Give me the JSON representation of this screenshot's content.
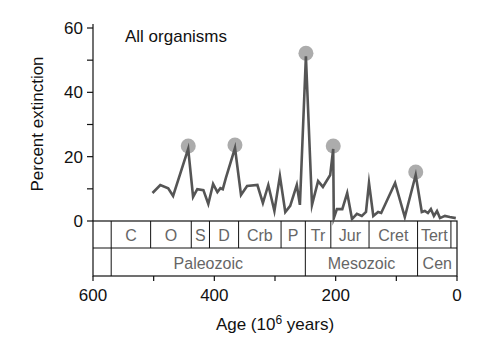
{
  "chart_data": {
    "type": "line",
    "title": "All organisms",
    "xlabel": "Age (10⁶ years)",
    "xlabel_parts": {
      "main": "Age (10",
      "sup": "6",
      "tail": " years)"
    },
    "ylabel": "Percent extinction",
    "xlim": [
      600,
      0
    ],
    "ylim": [
      0,
      60
    ],
    "x_ticks": [
      600,
      500,
      400,
      300,
      200,
      100,
      0
    ],
    "x_tick_labels": [
      "600",
      "400",
      "200",
      "0"
    ],
    "x_tick_label_values": [
      600,
      400,
      200,
      0
    ],
    "y_ticks": [
      0,
      10,
      20,
      30,
      40,
      50,
      60
    ],
    "y_tick_labels": [
      "0",
      "20",
      "40",
      "60"
    ],
    "y_tick_label_values": [
      0,
      20,
      40,
      60
    ],
    "grid": false,
    "legend": null,
    "series": [
      {
        "name": "All organisms",
        "color": "#555555",
        "x": [
          502,
          489,
          476,
          468,
          443,
          435,
          428,
          418,
          410,
          402,
          395,
          390,
          386,
          381,
          366,
          356,
          346,
          329,
          320,
          311,
          301,
          292,
          283,
          275,
          264,
          259,
          249,
          239,
          229,
          221,
          209,
          204,
          203,
          198,
          189,
          181,
          173,
          165,
          157,
          150,
          145,
          138,
          130,
          125,
          102,
          86,
          68,
          58,
          53,
          48,
          43,
          38,
          33,
          28,
          20,
          12,
          2
        ],
        "values": [
          8.7,
          11.2,
          10.2,
          7.8,
          22.4,
          7.5,
          9.9,
          9.6,
          5.3,
          11.5,
          9.0,
          10.2,
          9.9,
          13.4,
          22.7,
          8.1,
          10.9,
          11.2,
          5.6,
          11.2,
          3.1,
          14.0,
          2.8,
          4.7,
          11.2,
          5.0,
          51.2,
          5.0,
          12.4,
          10.6,
          14.3,
          22.4,
          0.9,
          3.7,
          3.7,
          8.7,
          0.6,
          2.2,
          1.6,
          2.8,
          11.8,
          1.6,
          2.8,
          2.5,
          11.8,
          1.2,
          14.3,
          2.8,
          3.1,
          2.5,
          3.7,
          1.6,
          3.1,
          0.9,
          1.6,
          1.2,
          0.9
        ]
      }
    ],
    "annotations": {
      "mass_extinction_markers": {
        "color": "#a8a8a8",
        "points": [
          {
            "x": 443,
            "y": 22.4
          },
          {
            "x": 366,
            "y": 22.7
          },
          {
            "x": 249,
            "y": 51.2
          },
          {
            "x": 204,
            "y": 22.4
          },
          {
            "x": 68,
            "y": 14.3
          }
        ]
      }
    },
    "timescale": {
      "periods": [
        {
          "label": "",
          "start": 600,
          "end": 570
        },
        {
          "label": "C",
          "start": 570,
          "end": 505
        },
        {
          "label": "O",
          "start": 505,
          "end": 438
        },
        {
          "label": "S",
          "start": 438,
          "end": 408
        },
        {
          "label": "D",
          "start": 408,
          "end": 360
        },
        {
          "label": "Crb",
          "start": 360,
          "end": 290
        },
        {
          "label": "P",
          "start": 290,
          "end": 250
        },
        {
          "label": "Tr",
          "start": 250,
          "end": 208
        },
        {
          "label": "Jur",
          "start": 208,
          "end": 145
        },
        {
          "label": "Cret",
          "start": 145,
          "end": 65
        },
        {
          "label": "Tert",
          "start": 65,
          "end": 10
        },
        {
          "label": "",
          "start": 10,
          "end": 0
        }
      ],
      "eras": [
        {
          "label": "",
          "start": 600,
          "end": 570
        },
        {
          "label": "Paleozoic",
          "start": 570,
          "end": 250
        },
        {
          "label": "Mesozoic",
          "start": 250,
          "end": 65
        },
        {
          "label": "Cen",
          "start": 65,
          "end": 0
        }
      ]
    }
  }
}
